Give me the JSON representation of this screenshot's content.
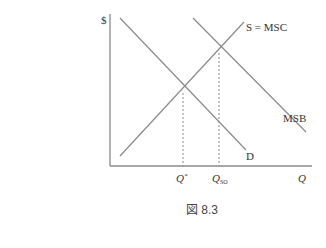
{
  "figure": {
    "caption": "図 8.3",
    "y_axis_label": "$",
    "x_axis_label": "Q",
    "curves": {
      "supply": {
        "label": "S = MSC"
      },
      "msb": {
        "label": "MSB"
      },
      "demand": {
        "label": "D"
      }
    },
    "x_ticks": {
      "q_star": {
        "main": "Q",
        "sup": "*"
      },
      "q_so": {
        "main": "Q",
        "sub": "SO"
      }
    },
    "colors": {
      "line": "#8a8a8a",
      "axis": "#8a8a8a",
      "text": "#333333"
    }
  }
}
